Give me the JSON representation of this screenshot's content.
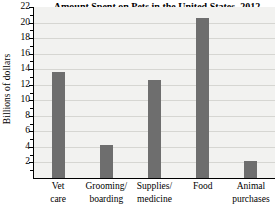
{
  "chart_data": {
    "type": "bar",
    "title": "Amount Spent on Pets in the United States, 2012",
    "xlabel": "",
    "ylabel": "Billions of dollars",
    "categories": [
      "Vet care",
      "Grooming/ boarding",
      "Supplies/ medicine",
      "Food",
      "Animal purchases"
    ],
    "category_lines": [
      [
        "Vet",
        "care"
      ],
      [
        "Grooming/",
        "boarding"
      ],
      [
        "Supplies/",
        "medicine"
      ],
      [
        "Food",
        ""
      ],
      [
        "Animal",
        "purchases"
      ]
    ],
    "values": [
      13.6,
      4.2,
      12.6,
      20.6,
      2.2
    ],
    "ylim": [
      0,
      22
    ],
    "ytick_values": [
      2,
      4,
      6,
      8,
      10,
      12,
      14,
      16,
      18,
      20,
      22
    ],
    "ytick_labels": [
      "2",
      "4",
      "6",
      "8",
      "10",
      "12",
      "14",
      "16",
      "18",
      "20",
      "22"
    ],
    "yminor_step": 1,
    "grid": "horizontal",
    "legend": "none",
    "bar_color": "#6e6e6e",
    "plot_background": "#f2f2f0",
    "gridline_color": "#d6d6d2",
    "axis_color": "#000000"
  }
}
